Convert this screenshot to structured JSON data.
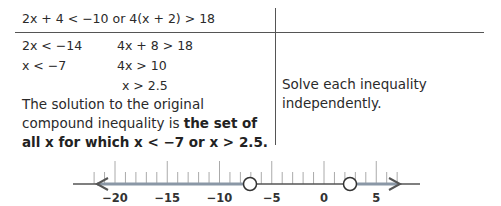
{
  "header": {
    "equation": "2x + 4 < −10 or 4(x + 2) > 18"
  },
  "steps": {
    "left": [
      "2x < −14",
      "x < −7"
    ],
    "right": [
      "4x + 8 > 18",
      "4x > 10",
      "x > 2.5"
    ]
  },
  "conclusion": {
    "prefix": "The solution to the original compound inequality is ",
    "bold": "the set of all x for which x < −7 or x > 2.5."
  },
  "note": "Solve each inequality independently.",
  "number_line": {
    "min_tick": -22,
    "max_tick": 7,
    "labels": [
      "−20",
      "−15",
      "−10",
      "−5",
      "0",
      "5"
    ],
    "label_values": [
      -20,
      -15,
      -10,
      -5,
      0,
      5
    ],
    "open_points": [
      -7,
      2.5
    ],
    "rays": [
      "x < −7",
      "x > 2.5"
    ],
    "line_color": "#555555",
    "ray_color": "#8a97a6"
  }
}
